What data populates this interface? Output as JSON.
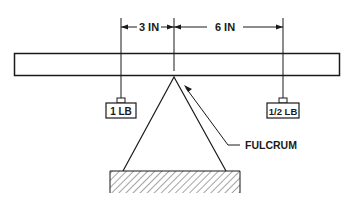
{
  "diagram": {
    "type": "lever",
    "dimensions": {
      "left_distance": "3 IN",
      "right_distance": "6 IN"
    },
    "weights": {
      "left": "1 LB",
      "right": "1/2 LB"
    },
    "fulcrum_label": "FULCRUM",
    "colors": {
      "ink": "#1a1a1a",
      "background": "#ffffff"
    }
  }
}
